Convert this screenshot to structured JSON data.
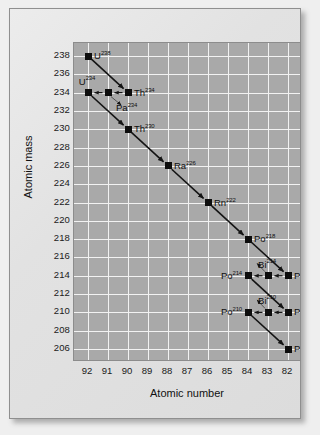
{
  "chart_data": {
    "type": "scatter",
    "title": "",
    "xlabel": "Atomic number",
    "ylabel": "Atomic mass",
    "xticks": [
      92,
      91,
      90,
      89,
      88,
      87,
      86,
      85,
      84,
      83,
      82
    ],
    "yticks": [
      238,
      236,
      234,
      232,
      230,
      228,
      226,
      224,
      222,
      220,
      218,
      216,
      214,
      212,
      210,
      208,
      206
    ],
    "xlim": [
      92,
      82
    ],
    "ylim": [
      206,
      238
    ],
    "x_axis_reversed": true,
    "grid": true,
    "legend": "none",
    "points": [
      {
        "label": "U",
        "mass": 238,
        "z": 92,
        "text": "U238",
        "element": "U",
        "superscript": "238",
        "label_pos": "right"
      },
      {
        "label": "Th",
        "mass": 234,
        "z": 90,
        "text": "Th234",
        "element": "Th",
        "superscript": "234",
        "label_pos": "right"
      },
      {
        "label": "Pa",
        "mass": 234,
        "z": 91,
        "text": "Pa234",
        "element": "Pa",
        "superscript": "234",
        "label_pos": "below"
      },
      {
        "label": "U",
        "mass": 234,
        "z": 92,
        "text": "U234",
        "element": "U",
        "superscript": "234",
        "label_pos": "above"
      },
      {
        "label": "Th",
        "mass": 230,
        "z": 90,
        "text": "Th230",
        "element": "Th",
        "superscript": "230",
        "label_pos": "right"
      },
      {
        "label": "Ra",
        "mass": 226,
        "z": 88,
        "text": "Ra226",
        "element": "Ra",
        "superscript": "226",
        "label_pos": "right"
      },
      {
        "label": "Rn",
        "mass": 222,
        "z": 86,
        "text": "Rn222",
        "element": "Rn",
        "superscript": "222",
        "label_pos": "right"
      },
      {
        "label": "Po",
        "mass": 218,
        "z": 84,
        "text": "Po218",
        "element": "Po",
        "superscript": "218",
        "label_pos": "right"
      },
      {
        "label": "Pb",
        "mass": 214,
        "z": 82,
        "text": "Pb214",
        "element": "Pb",
        "superscript": "214",
        "label_pos": "right"
      },
      {
        "label": "Bi",
        "mass": 214,
        "z": 83,
        "text": "Bi214",
        "element": "Bi",
        "superscript": "214",
        "label_pos": "above"
      },
      {
        "label": "Po",
        "mass": 214,
        "z": 84,
        "text": "Po214",
        "element": "Po",
        "superscript": "214",
        "label_pos": "left"
      },
      {
        "label": "Pb",
        "mass": 210,
        "z": 82,
        "text": "Pb210",
        "element": "Pb",
        "superscript": "210",
        "label_pos": "right"
      },
      {
        "label": "Bi",
        "mass": 210,
        "z": 83,
        "text": "Bi210",
        "element": "Bi",
        "superscript": "210",
        "label_pos": "above"
      },
      {
        "label": "Po",
        "mass": 210,
        "z": 84,
        "text": "Po210",
        "element": "Po",
        "superscript": "210",
        "label_pos": "left"
      },
      {
        "label": "Pb",
        "mass": 206,
        "z": 82,
        "text": "Pb206",
        "element": "Pb",
        "superscript": "206",
        "label_pos": "right"
      }
    ],
    "decays": [
      {
        "from": {
          "z": 92,
          "mass": 238
        },
        "to": {
          "z": 90,
          "mass": 234
        },
        "type": "alpha"
      },
      {
        "from": {
          "z": 90,
          "mass": 234
        },
        "to": {
          "z": 91,
          "mass": 234
        },
        "type": "beta"
      },
      {
        "from": {
          "z": 91,
          "mass": 234
        },
        "to": {
          "z": 92,
          "mass": 234
        },
        "type": "beta"
      },
      {
        "from": {
          "z": 92,
          "mass": 234
        },
        "to": {
          "z": 90,
          "mass": 230
        },
        "type": "alpha"
      },
      {
        "from": {
          "z": 90,
          "mass": 230
        },
        "to": {
          "z": 88,
          "mass": 226
        },
        "type": "alpha"
      },
      {
        "from": {
          "z": 88,
          "mass": 226
        },
        "to": {
          "z": 86,
          "mass": 222
        },
        "type": "alpha"
      },
      {
        "from": {
          "z": 86,
          "mass": 222
        },
        "to": {
          "z": 84,
          "mass": 218
        },
        "type": "alpha"
      },
      {
        "from": {
          "z": 84,
          "mass": 218
        },
        "to": {
          "z": 82,
          "mass": 214
        },
        "type": "alpha"
      },
      {
        "from": {
          "z": 82,
          "mass": 214
        },
        "to": {
          "z": 83,
          "mass": 214
        },
        "type": "beta"
      },
      {
        "from": {
          "z": 83,
          "mass": 214
        },
        "to": {
          "z": 84,
          "mass": 214
        },
        "type": "beta"
      },
      {
        "from": {
          "z": 84,
          "mass": 214
        },
        "to": {
          "z": 82,
          "mass": 210
        },
        "type": "alpha"
      },
      {
        "from": {
          "z": 82,
          "mass": 210
        },
        "to": {
          "z": 83,
          "mass": 210
        },
        "type": "beta"
      },
      {
        "from": {
          "z": 83,
          "mass": 210
        },
        "to": {
          "z": 84,
          "mass": 210
        },
        "type": "beta"
      },
      {
        "from": {
          "z": 84,
          "mass": 210
        },
        "to": {
          "z": 82,
          "mass": 206
        },
        "type": "alpha"
      }
    ]
  },
  "colors": {
    "plot_background": "#a9a9a9",
    "grid": "#f2f2f2",
    "marker": "#0d0d0d",
    "arrow": "#141414",
    "card_background": "#e6e6e6",
    "page_background": "#efefef",
    "text": "#111111"
  }
}
